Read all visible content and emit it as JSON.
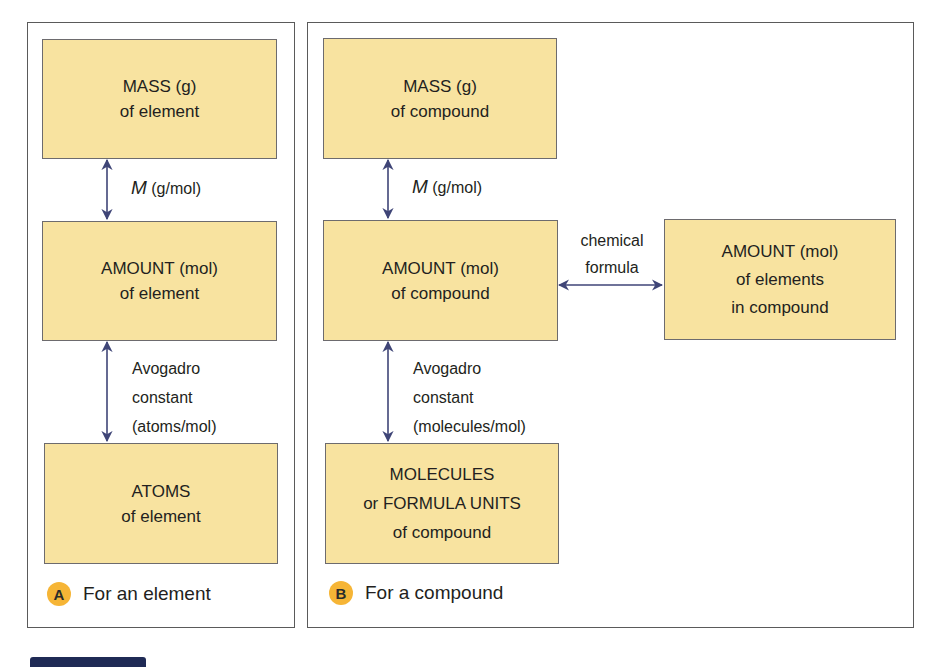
{
  "colors": {
    "box_fill": "#f8e3a0",
    "box_border": "#6d6b6e",
    "arrow": "#3f4577",
    "badge": "#f6b536",
    "panel_border": "#5a5a5a",
    "bottom_bar": "#1f2a55"
  },
  "panel_a": {
    "badge": "A",
    "caption": "For an element",
    "boxes": [
      {
        "line1": "MASS (g)",
        "line2": "of element"
      },
      {
        "line1": "AMOUNT (mol)",
        "line2": "of element"
      },
      {
        "line1": "ATOMS",
        "line2": "of element"
      }
    ],
    "conversions": [
      {
        "symbol": "M",
        "unit": "(g/mol)"
      },
      {
        "line1": "Avogadro",
        "line2": "constant",
        "line3": "(atoms/mol)"
      }
    ]
  },
  "panel_b": {
    "badge": "B",
    "caption": "For a compound",
    "boxes": [
      {
        "line1": "MASS (g)",
        "line2": "of compound"
      },
      {
        "line1": "AMOUNT (mol)",
        "line2": "of compound"
      },
      {
        "line1": "MOLECULES",
        "line2": "or FORMULA UNITS",
        "line3": "of compound"
      },
      {
        "line1": "AMOUNT (mol)",
        "line2": "of elements",
        "line3": "in compound"
      }
    ],
    "conversions": [
      {
        "symbol": "M",
        "unit": "(g/mol)"
      },
      {
        "line1": "Avogadro",
        "line2": "constant",
        "line3": "(molecules/mol)"
      },
      {
        "line1": "chemical",
        "line2": "formula"
      }
    ]
  }
}
